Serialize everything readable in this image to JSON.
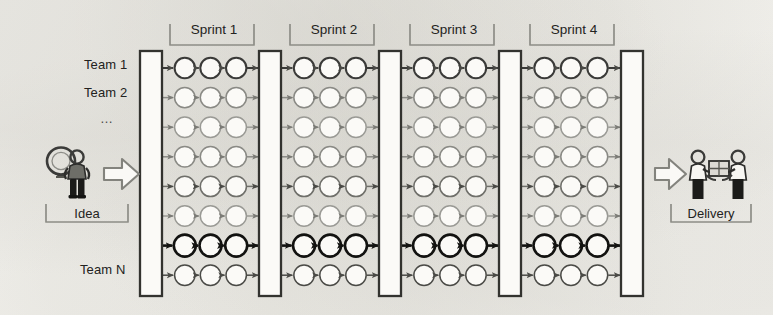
{
  "figure": {
    "kind": "agile-scaled-delivery-diagram",
    "background_color": "#f3f2ee",
    "ink_color": "#3a3a38",
    "bold_ink_color": "#121210",
    "light_ink_color": "#8d8d88"
  },
  "left": {
    "icon": "lightbulb-person-icon",
    "caption": "Idea",
    "arrow": "right-arrow-icon"
  },
  "right": {
    "icon": "handoff-people-icon",
    "caption": "Delivery",
    "arrow": "right-arrow-icon"
  },
  "row_labels": [
    {
      "text": "Team 1",
      "row": 1
    },
    {
      "text": "Team 2",
      "row": 2
    },
    {
      "text": "…",
      "row": 3
    },
    {
      "text": "Team N",
      "row": 8
    }
  ],
  "sprints": [
    {
      "label": "Sprint 1",
      "index": 1
    },
    {
      "label": "Sprint 2",
      "index": 2
    },
    {
      "label": "Sprint 3",
      "index": 3
    },
    {
      "label": "Sprint 4",
      "index": 4
    }
  ],
  "grid": {
    "rows": 8,
    "nodes_per_sprint": 3,
    "bars": 5,
    "bar_name": "synchronization-bar",
    "node_name": "work-item-node",
    "emphasized_row": 7,
    "row_tones": [
      "#3a3a38",
      "#8a8a85",
      "#9a9a95",
      "#8a8a85",
      "#6f6f6a",
      "#9a9a95",
      "#121210",
      "#4a4a46"
    ]
  },
  "chart_data": {
    "type": "diagram",
    "title": "",
    "columns": [
      "Sprint 1",
      "Sprint 2",
      "Sprint 3",
      "Sprint 4"
    ],
    "rows": [
      "Team 1",
      "Team 2",
      "…",
      "",
      "",
      "",
      "",
      "Team N"
    ],
    "nodes_per_cell": 3,
    "start_label": "Idea",
    "end_label": "Delivery"
  }
}
